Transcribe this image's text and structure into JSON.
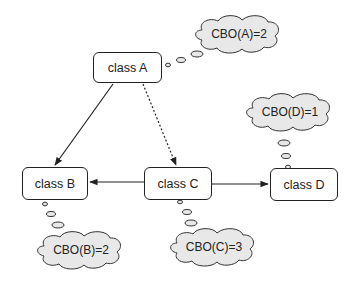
{
  "diagram": {
    "classes": [
      {
        "id": "A",
        "label": "class A"
      },
      {
        "id": "B",
        "label": "class B"
      },
      {
        "id": "C",
        "label": "class C"
      },
      {
        "id": "D",
        "label": "class D"
      }
    ],
    "metrics": [
      {
        "class": "A",
        "label": "CBO(A)=2"
      },
      {
        "class": "B",
        "label": "CBO(B)=2"
      },
      {
        "class": "C",
        "label": "CBO(C)=3"
      },
      {
        "class": "D",
        "label": "CBO(D)=1"
      }
    ],
    "edges": [
      {
        "from": "A",
        "to": "B",
        "style": "solid"
      },
      {
        "from": "A",
        "to": "C",
        "style": "dashed"
      },
      {
        "from": "C",
        "to": "B",
        "style": "solid"
      },
      {
        "from": "C",
        "to": "D",
        "style": "solid"
      }
    ],
    "colors": {
      "stroke": "#222222",
      "cloud_fill": "#e8e8e8",
      "box_fill": "#ffffff"
    }
  }
}
